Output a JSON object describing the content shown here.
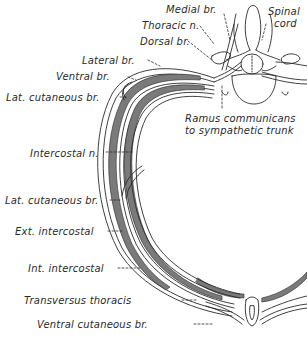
{
  "figure": {
    "type": "anatomical-diagram",
    "colors": {
      "background": "#ffffff",
      "ink": "#2a2a2a",
      "muscle_fill": "#7a7a7a"
    }
  },
  "labels": {
    "medial_br": "Medial br.",
    "spinal_cord_line1": "Spinal",
    "spinal_cord_line2": "cord",
    "thoracic_n": "Thoracic n.",
    "dorsal_br": "Dorsal br.",
    "lateral_br": "Lateral br.",
    "ventral_br": "Ventral br.",
    "lat_cutaneous_br_upper": "Lat. cutaneous br.",
    "ramus_line1": "Ramus communicans",
    "ramus_line2": "to sympathetic trunk",
    "intercostal_n": "Intercostal n.",
    "lat_cutaneous_br_lower": "Lat. cutaneous br.",
    "ext_intercostal": "Ext. intercostal",
    "int_intercostal": "Int. intercostal",
    "transversus_thoracis": "Transversus thoracis",
    "ventral_cutaneous_br": "Ventral cutaneous br."
  }
}
